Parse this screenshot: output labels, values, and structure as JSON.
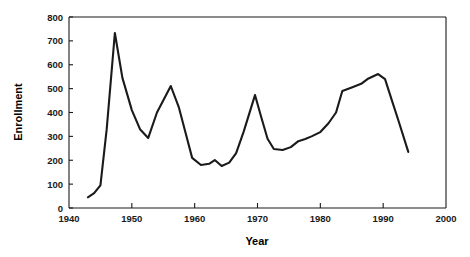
{
  "chart_data": {
    "type": "line",
    "title": "",
    "xlabel": "Year",
    "ylabel": "Enrollment",
    "xlim": [
      1940,
      2000
    ],
    "ylim": [
      0,
      800
    ],
    "grid": false,
    "legend": null,
    "xticks": [
      1940,
      1950,
      1960,
      1970,
      1980,
      1990,
      2000
    ],
    "xtick_labels": [
      "1940",
      "1950",
      "1960",
      "1970",
      "1980",
      "1990",
      "2000"
    ],
    "yticks": [
      0,
      100,
      200,
      300,
      400,
      500,
      600,
      700,
      800
    ],
    "ytick_labels": [
      "0",
      "100",
      "200",
      "300",
      "400",
      "500",
      "600",
      "700",
      "800"
    ],
    "series": [
      {
        "name": "Enrollment",
        "color": "#1a1a1a",
        "x": [
          1943.0,
          1944.0,
          1945.0,
          1946.0,
          1947.3,
          1948.5,
          1950.0,
          1951.3,
          1952.6,
          1954.0,
          1956.2,
          1957.5,
          1958.6,
          1959.6,
          1961.0,
          1962.3,
          1963.2,
          1964.3,
          1965.5,
          1966.6,
          1967.8,
          1969.6,
          1970.6,
          1971.6,
          1972.6,
          1974.0,
          1975.3,
          1976.5,
          1977.6,
          1978.6,
          1980.0,
          1981.3,
          1982.5,
          1983.5,
          1985.0,
          1986.5,
          1987.5,
          1989.2,
          1990.3,
          1991.4,
          1992.5,
          1994.0
        ],
        "y": [
          45,
          62,
          95,
          330,
          733,
          545,
          410,
          330,
          293,
          400,
          511,
          420,
          310,
          210,
          180,
          185,
          201,
          176,
          190,
          230,
          320,
          473,
          380,
          290,
          247,
          243,
          255,
          280,
          289,
          300,
          318,
          355,
          400,
          490,
          505,
          520,
          540,
          561,
          540,
          450,
          360,
          235
        ]
      }
    ]
  },
  "axes": {
    "x_title": "Year",
    "y_title": "Enrollment"
  }
}
